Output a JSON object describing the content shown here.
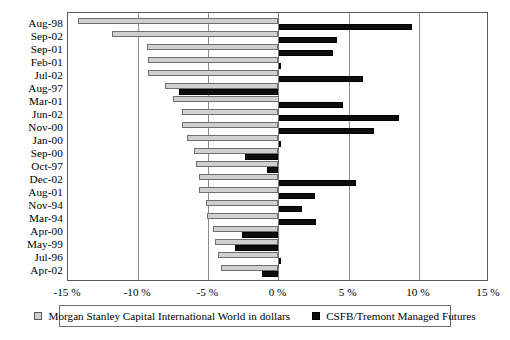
{
  "chart_data": {
    "type": "bar",
    "orientation": "horizontal",
    "title": "",
    "xlabel": "",
    "ylabel": "",
    "xlim": [
      -15,
      15
    ],
    "xticks": [
      -15,
      -10,
      -5,
      0,
      5,
      10,
      15
    ],
    "xticklabels": [
      "-15 %",
      "-10 %",
      "-5 %",
      "0 %",
      "5 %",
      "10 %",
      "15 %"
    ],
    "grid": "vertical",
    "legend_position": "bottom",
    "categories": [
      "Aug-98",
      "Sep-02",
      "Sep-01",
      "Feb-01",
      "Jul-02",
      "Aug-97",
      "Mar-01",
      "Jun-02",
      "Nov-00",
      "Jan-00",
      "Sep-00",
      "Oct-97",
      "Dec-02",
      "Aug-01",
      "Nov-94",
      "Mar-94",
      "Apr-00",
      "May-99",
      "Jul-96",
      "Apr-02"
    ],
    "series": [
      {
        "name": "Morgan Stanley Capital International World in dollars",
        "color": "#d0d0d0",
        "values": [
          -14.3,
          -11.9,
          -9.4,
          -9.3,
          -9.3,
          -8.1,
          -7.5,
          -6.9,
          -6.9,
          -6.5,
          -6.0,
          -5.9,
          -5.7,
          -5.7,
          -5.2,
          -5.1,
          -4.7,
          -4.5,
          -4.3,
          -4.1
        ]
      },
      {
        "name": "CSFB/Tremont Managed Futures",
        "color": "#0d0d0d",
        "values": [
          9.5,
          4.2,
          3.9,
          0.15,
          6.0,
          -7.1,
          4.6,
          8.6,
          6.8,
          0.0,
          -2.4,
          -0.8,
          5.5,
          2.6,
          1.7,
          2.7,
          -2.6,
          -3.1,
          0.1,
          -1.2
        ]
      }
    ]
  },
  "legend": {
    "items": [
      {
        "swatch": "gray",
        "label": "Morgan Stanley Capital International World in dollars"
      },
      {
        "swatch": "black",
        "label": "CSFB/Tremont Managed Futures"
      }
    ]
  }
}
